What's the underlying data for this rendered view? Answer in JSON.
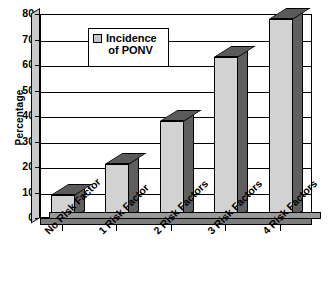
{
  "chart_data": {
    "type": "bar",
    "title": "",
    "xlabel": "",
    "ylabel": "Percentage",
    "ylim": [
      0,
      80
    ],
    "ytick_step": 10,
    "grid": true,
    "legend_position": "upper-left-inside",
    "categories": [
      "No Risk Factor",
      "1 Risk Factor",
      "2 Risk Factors",
      "3 Risk Factors",
      "4 Risk Factors"
    ],
    "series": [
      {
        "name": "Incidence of PONV",
        "values": [
          9,
          21,
          38,
          63,
          78
        ]
      }
    ],
    "ytick_labels": [
      "0",
      "10",
      "20",
      "30",
      "40",
      "50",
      "60",
      "70",
      "80"
    ],
    "style": {
      "bar_front_color": "#d2d2d2",
      "bar_shade_color": "#5f5f5f",
      "axis_color": "#000000",
      "background": "#ffffff"
    }
  },
  "legend": {
    "line1": "Incidence",
    "line2": "of PONV",
    "swatch_color": "#c6c6c6"
  },
  "axis": {
    "y_title": "Percentage"
  }
}
